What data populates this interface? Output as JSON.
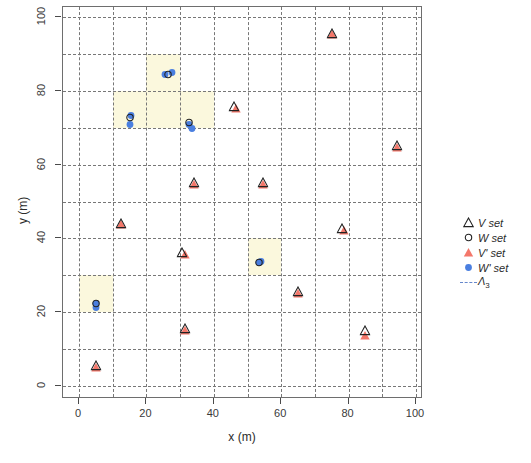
{
  "chart_data": {
    "type": "scatter",
    "title": "",
    "xlabel": "x (m)",
    "ylabel": "y (m)",
    "xlim": [
      0,
      100
    ],
    "ylim": [
      0,
      100
    ],
    "xticks": [
      0,
      20,
      40,
      60,
      80,
      100
    ],
    "yticks": [
      0,
      20,
      40,
      60,
      80,
      100
    ],
    "grid": true,
    "grid_step": 10,
    "grid_style": "dashed",
    "legend_position": "right",
    "legend": [
      {
        "key": "triangle-open",
        "label": "V set",
        "color": "#222222"
      },
      {
        "key": "circle-open",
        "label": "W set",
        "color": "#222222"
      },
      {
        "key": "triangle-filled",
        "label": "V' set",
        "color": "#f4776a"
      },
      {
        "key": "circle-filled",
        "label": "W' set",
        "color": "#4a7fe0"
      },
      {
        "key": "dashed-line",
        "label": "Λ",
        "sublabel": "3",
        "color": "#6688cc"
      }
    ],
    "series": [
      {
        "name": "V set",
        "marker": "triangle-open",
        "color": "#222222",
        "points": [
          {
            "x": 75,
            "y": 95.5
          },
          {
            "x": 46,
            "y": 75.5
          },
          {
            "x": 94.5,
            "y": 65
          },
          {
            "x": 34,
            "y": 55
          },
          {
            "x": 54.5,
            "y": 55
          },
          {
            "x": 78,
            "y": 42.5
          },
          {
            "x": 12.5,
            "y": 44
          },
          {
            "x": 30.5,
            "y": 36
          },
          {
            "x": 65,
            "y": 25.5
          },
          {
            "x": 31.5,
            "y": 15.5
          },
          {
            "x": 85,
            "y": 15
          },
          {
            "x": 5,
            "y": 5.5
          }
        ]
      },
      {
        "name": "W set",
        "marker": "circle-open",
        "color": "#222222",
        "points": [
          {
            "x": 26.5,
            "y": 84.5
          },
          {
            "x": 15,
            "y": 73
          },
          {
            "x": 32.5,
            "y": 71.5
          },
          {
            "x": 53.5,
            "y": 33.5
          },
          {
            "x": 5,
            "y": 22.5
          }
        ]
      },
      {
        "name": "V' set",
        "marker": "triangle-filled",
        "color": "#f4776a",
        "points": [
          {
            "x": 75,
            "y": 95
          },
          {
            "x": 46.5,
            "y": 75
          },
          {
            "x": 94.5,
            "y": 64.5
          },
          {
            "x": 34,
            "y": 54.5
          },
          {
            "x": 54.5,
            "y": 54.5
          },
          {
            "x": 78.5,
            "y": 42
          },
          {
            "x": 12.5,
            "y": 43.5
          },
          {
            "x": 31.5,
            "y": 35.5
          },
          {
            "x": 65,
            "y": 25
          },
          {
            "x": 31.5,
            "y": 15
          },
          {
            "x": 85,
            "y": 13.5
          },
          {
            "x": 5,
            "y": 5
          }
        ]
      },
      {
        "name": "W' set",
        "marker": "circle-filled",
        "color": "#4a7fe0",
        "points": [
          {
            "x": 25.5,
            "y": 84.5
          },
          {
            "x": 27.5,
            "y": 85
          },
          {
            "x": 15.5,
            "y": 73.5
          },
          {
            "x": 15,
            "y": 71
          },
          {
            "x": 32.5,
            "y": 71
          },
          {
            "x": 33.5,
            "y": 70
          },
          {
            "x": 53.5,
            "y": 33.5
          },
          {
            "x": 54,
            "y": 34
          },
          {
            "x": 5,
            "y": 22.5
          },
          {
            "x": 5,
            "y": 21.5
          }
        ]
      }
    ],
    "highlighted_cells": [
      {
        "x0": 20,
        "y0": 80,
        "x1": 30,
        "y1": 90
      },
      {
        "x0": 10,
        "y0": 70,
        "x1": 20,
        "y1": 80
      },
      {
        "x0": 20,
        "y0": 70,
        "x1": 40,
        "y1": 80
      },
      {
        "x0": 50,
        "y0": 30,
        "x1": 60,
        "y1": 40
      },
      {
        "x0": 0,
        "y0": 20,
        "x1": 10,
        "y1": 30
      }
    ]
  }
}
